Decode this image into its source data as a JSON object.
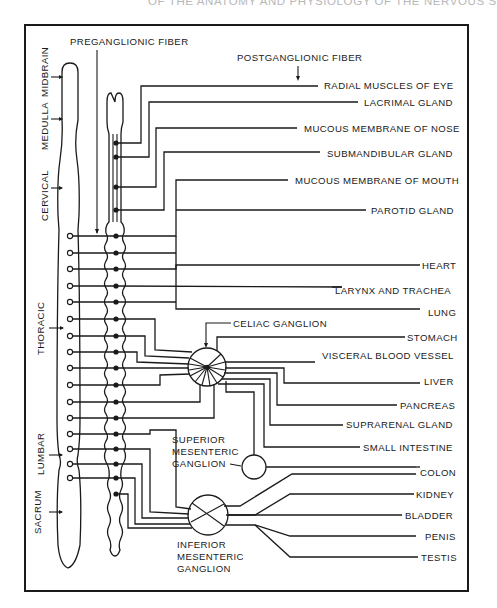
{
  "running_header": "OF THE ANATOMY AND PHYSIOLOGY OF THE NERVOUS S",
  "diagram": {
    "type": "sympathetic nervous system schematic",
    "labels": {
      "preganglionic_fiber": "PREGANGLIONIC FIBER",
      "postganglionic_fiber": "POSTGANGLIONIC FIBER",
      "celiac_ganglion": "CELIAC GANGLION",
      "superior_mesenteric_ganglion": [
        "SUPERIOR",
        "MESENTERIC",
        "GANGLION"
      ],
      "inferior_mesenteric_ganglion": [
        "INFERIOR",
        "MESENTERIC",
        "GANGLION"
      ]
    },
    "cord_regions": [
      "MIDBRAIN",
      "MEDULLA",
      "CERVICAL",
      "THORACIC",
      "LUMBAR",
      "SACRUM"
    ],
    "targets": [
      "RADIAL MUSCLES OF EYE",
      "LACRIMAL GLAND",
      "MUCOUS MEMBRANE OF NOSE",
      "SUBMANDIBULAR GLAND",
      "MUCOUS MEMBRANE OF MOUTH",
      "PAROTID GLAND",
      "HEART",
      "LARYNX AND TRACHEA",
      "LUNG",
      "STOMACH",
      "VISCERAL BLOOD VESSEL",
      "LIVER",
      "PANCREAS",
      "SUPRARENAL GLAND",
      "SMALL INTESTINE",
      "COLON",
      "KIDNEY",
      "BLADDER",
      "PENIS",
      "TESTIS"
    ]
  }
}
